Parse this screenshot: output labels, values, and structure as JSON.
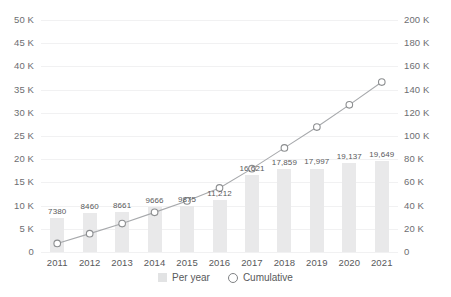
{
  "chart_data": {
    "type": "bar",
    "title": "",
    "subtitle": "",
    "xlabel": "",
    "ylabel": "",
    "categories": [
      "2011",
      "2012",
      "2013",
      "2014",
      "2015",
      "2016",
      "2017",
      "2018",
      "2019",
      "2020",
      "2021"
    ],
    "series": [
      {
        "name": "Per year",
        "type": "bar",
        "axis": "left",
        "values": [
          7380,
          8460,
          8661,
          9666,
          9875,
          11212,
          16621,
          17859,
          17997,
          19137,
          19649
        ],
        "labels": [
          "7380",
          "8460",
          "8661",
          "9666",
          "9875",
          "11,212",
          "16,621",
          "17,859",
          "17,997",
          "19,137",
          "19,649"
        ],
        "color": "#e9e9ea"
      },
      {
        "name": "Cumulative",
        "type": "line",
        "axis": "right",
        "values": [
          7380,
          15840,
          24501,
          34167,
          44042,
          55254,
          71875,
          89734,
          107731,
          126868,
          146517
        ],
        "color": "#a7a9ac",
        "marker": "open-circle"
      }
    ],
    "left_axis": {
      "min": 0,
      "max": 50000,
      "step": 5000,
      "ticks": [
        "0",
        "5 K",
        "10 K",
        "15 K",
        "20 K",
        "25 K",
        "30 K",
        "35 K",
        "40 K",
        "45 K",
        "50 K"
      ]
    },
    "right_axis": {
      "min": 0,
      "max": 200000,
      "step": 20000,
      "ticks": [
        "0",
        "20 K",
        "40 K",
        "60 K",
        "80 K",
        "100 K",
        "120 K",
        "140 K",
        "160 K",
        "180 K",
        "200 K"
      ]
    },
    "grid": true,
    "legend_position": "bottom",
    "legend": [
      {
        "label": "Per year",
        "marker": "square",
        "color": "#e2e3e4"
      },
      {
        "label": "Cumulative",
        "marker": "open-circle",
        "color": "#808285"
      }
    ]
  }
}
